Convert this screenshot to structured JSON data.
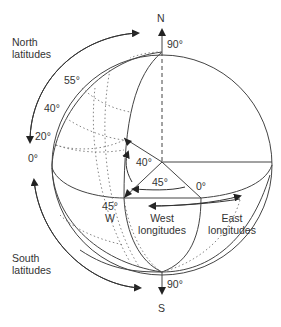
{
  "diagram": {
    "type": "latitude-longitude-globe",
    "poles": {
      "north": "N",
      "south": "S",
      "north_angle": "90°",
      "south_angle": "90°"
    },
    "latitude_labels": [
      "55°",
      "40°",
      "20°",
      "0°"
    ],
    "angle_labels": {
      "latitude_angle": "40°",
      "longitude_angle": "45°",
      "prime_meridian": "0°",
      "west_longitude": "45°",
      "west_letter": "W"
    },
    "region_labels": {
      "north_latitudes": [
        "North",
        "latitudes"
      ],
      "south_latitudes": [
        "South",
        "latitudes"
      ],
      "west_longitudes": [
        "West",
        "longitudes"
      ],
      "east_longitudes": [
        "East",
        "longitudes"
      ]
    },
    "colors": {
      "line": "#333333",
      "text": "#333333",
      "background": "#ffffff"
    }
  }
}
